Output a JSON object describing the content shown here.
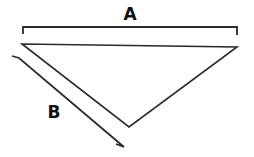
{
  "figure": {
    "background_color": "#ffffff",
    "stroke_color": "#2b2b2b",
    "label_color": "#111111",
    "canvas": {
      "width": 254,
      "height": 157
    }
  },
  "shape": {
    "name": "triangle",
    "type": "downward-pointing-triangle",
    "vertices": [
      {
        "name": "top-left",
        "x": 22,
        "y": 44
      },
      {
        "name": "top-right",
        "x": 237,
        "y": 47
      },
      {
        "name": "bottom",
        "x": 129,
        "y": 127
      }
    ],
    "path": "M 22 44 L 237 47 L 129 127 Z"
  },
  "dimensions": [
    {
      "id": "A",
      "label": "A",
      "measures": "top-edge",
      "orientation": "horizontal",
      "label_position": {
        "x": 130,
        "y": 15
      },
      "line_path": "M 23 34 L 23 27 L 237 27 L 237 35",
      "extent": {
        "x1": 23,
        "x2": 237,
        "y": 27
      }
    },
    {
      "id": "B",
      "label": "B",
      "measures": "left-edge",
      "orientation": "diagonal",
      "label_position": {
        "x": 54,
        "y": 113
      },
      "line_path": "M 12 56 L 19 58 L 124 147 L 116 144",
      "extent": {
        "x1": 19,
        "y1": 58,
        "x2": 124,
        "y2": 147
      }
    }
  ]
}
